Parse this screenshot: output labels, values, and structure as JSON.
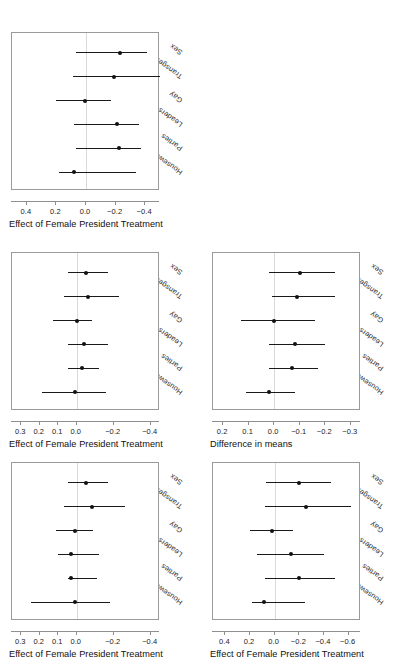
{
  "chart_data": [
    {
      "id": "panel-top-left",
      "type": "scatter",
      "title": "",
      "xlabel": "Effect of Female President Treatment",
      "ylabel": "",
      "xlim": [
        0.5,
        -0.5
      ],
      "xticks": [
        0.4,
        0.2,
        0.0,
        -0.2,
        -0.4
      ],
      "xticklabels": [
        "0.4",
        "0.2",
        "0.0",
        "-0.2",
        "-0.4"
      ],
      "categories": [
        "Sex",
        "Transgender",
        "Gay",
        "Leaders",
        "Parties",
        "Housework"
      ],
      "grid": false,
      "reference_line": 0.0,
      "points": [
        {
          "category": "Sex",
          "estimate": -0.23,
          "low": 0.07,
          "high": -0.41
        },
        {
          "category": "Transgender",
          "estimate": -0.19,
          "low": 0.09,
          "high": -0.5
        },
        {
          "category": "Gay",
          "estimate": 0.01,
          "low": 0.2,
          "high": -0.17
        },
        {
          "category": "Leaders",
          "estimate": -0.21,
          "low": 0.08,
          "high": -0.36
        },
        {
          "category": "Parties",
          "estimate": -0.22,
          "low": 0.07,
          "high": -0.37
        },
        {
          "category": "Housework",
          "estimate": 0.08,
          "low": 0.18,
          "high": -0.34
        }
      ]
    },
    {
      "id": "panel-mid-left",
      "type": "scatter",
      "title": "",
      "xlabel": "Effect of Female President Treatment",
      "ylabel": "",
      "xlim": [
        0.35,
        -0.45
      ],
      "xticks": [
        0.3,
        0.2,
        0.1,
        0.0,
        -0.2,
        -0.4
      ],
      "xticklabels": [
        "0.3",
        "0.2",
        "0.1",
        "0.0",
        "-0.2",
        "-0.4"
      ],
      "categories": [
        "Sex",
        "Transgender",
        "Gay",
        "Leaders",
        "Parties",
        "Housework"
      ],
      "grid": false,
      "reference_line": 0.0,
      "points": [
        {
          "category": "Sex",
          "estimate": -0.05,
          "low": 0.05,
          "high": -0.17
        },
        {
          "category": "Transgender",
          "estimate": -0.06,
          "low": 0.07,
          "high": -0.23
        },
        {
          "category": "Gay",
          "estimate": 0.0,
          "low": 0.13,
          "high": -0.08
        },
        {
          "category": "Leaders",
          "estimate": -0.04,
          "low": 0.05,
          "high": -0.17
        },
        {
          "category": "Parties",
          "estimate": -0.03,
          "low": 0.05,
          "high": -0.12
        },
        {
          "category": "Housework",
          "estimate": 0.01,
          "low": 0.19,
          "high": -0.16
        }
      ]
    },
    {
      "id": "panel-mid-right",
      "type": "scatter",
      "title": "",
      "xlabel": "Difference in means",
      "ylabel": "",
      "xlim": [
        0.24,
        -0.34
      ],
      "xticks": [
        0.2,
        0.1,
        0.0,
        -0.1,
        -0.2,
        -0.3
      ],
      "xticklabels": [
        "0.2",
        "0.1",
        "0.0",
        "-0.1",
        "-0.2",
        "-0.3"
      ],
      "categories": [
        "Sex",
        "Transgender",
        "Gay",
        "Leaders",
        "Parties",
        "Housework"
      ],
      "grid": false,
      "reference_line": 0.0,
      "points": [
        {
          "category": "Sex",
          "estimate": -0.1,
          "low": 0.02,
          "high": -0.24
        },
        {
          "category": "Transgender",
          "estimate": -0.09,
          "low": 0.01,
          "high": -0.24
        },
        {
          "category": "Gay",
          "estimate": 0.0,
          "low": 0.13,
          "high": -0.16
        },
        {
          "category": "Leaders",
          "estimate": -0.08,
          "low": 0.02,
          "high": -0.2
        },
        {
          "category": "Parties",
          "estimate": -0.07,
          "low": 0.02,
          "high": -0.17
        },
        {
          "category": "Housework",
          "estimate": 0.02,
          "low": 0.11,
          "high": -0.08
        }
      ]
    },
    {
      "id": "panel-bottom-left",
      "type": "scatter",
      "title": "",
      "xlabel": "Effect of Female President Treatment",
      "ylabel": "",
      "xlim": [
        0.35,
        -0.45
      ],
      "xticks": [
        0.3,
        0.2,
        0.1,
        0.0,
        -0.2,
        -0.4
      ],
      "xticklabels": [
        "0.3",
        "0.2",
        "0.1",
        "0.0",
        "-0.2",
        "-0.4"
      ],
      "categories": [
        "Sex",
        "Transgender",
        "Gay",
        "Leaders",
        "Parties",
        "Housework"
      ],
      "grid": false,
      "reference_line": 0.0,
      "points": [
        {
          "category": "Sex",
          "estimate": -0.05,
          "low": 0.05,
          "high": -0.17
        },
        {
          "category": "Transgender",
          "estimate": -0.08,
          "low": 0.07,
          "high": -0.26
        },
        {
          "category": "Gay",
          "estimate": 0.01,
          "low": 0.11,
          "high": -0.09
        },
        {
          "category": "Leaders",
          "estimate": 0.03,
          "low": 0.1,
          "high": -0.12
        },
        {
          "category": "Parties",
          "estimate": 0.03,
          "low": 0.05,
          "high": -0.11
        },
        {
          "category": "Housework",
          "estimate": 0.01,
          "low": 0.25,
          "high": -0.18
        }
      ]
    },
    {
      "id": "panel-bottom-right",
      "type": "scatter",
      "title": "",
      "xlabel": "Effect of Female President Treatment",
      "ylabel": "",
      "xlim": [
        0.5,
        -0.7
      ],
      "xticks": [
        0.4,
        0.2,
        0.0,
        -0.2,
        -0.4,
        -0.6
      ],
      "xticklabels": [
        "0.4",
        "0.2",
        "0.0",
        "-0.2",
        "-0.4",
        "-0.6"
      ],
      "categories": [
        "Sex",
        "Transgender",
        "Gay",
        "Leaders",
        "Parties",
        "Housework"
      ],
      "grid": false,
      "reference_line": 0.0,
      "points": [
        {
          "category": "Sex",
          "estimate": -0.2,
          "low": 0.07,
          "high": -0.46
        },
        {
          "category": "Transgender",
          "estimate": -0.25,
          "low": 0.08,
          "high": -0.62
        },
        {
          "category": "Gay",
          "estimate": 0.02,
          "low": 0.2,
          "high": -0.15
        },
        {
          "category": "Leaders",
          "estimate": -0.13,
          "low": 0.14,
          "high": -0.4
        },
        {
          "category": "Parties",
          "estimate": -0.2,
          "low": 0.08,
          "high": -0.49
        },
        {
          "category": "Housework",
          "estimate": 0.09,
          "low": 0.18,
          "high": -0.25
        }
      ]
    }
  ],
  "layout": {
    "panels": [
      {
        "ref": "panel-top-left",
        "left": 11,
        "top": 32,
        "width": 148,
        "height": 158
      },
      {
        "ref": "panel-mid-left",
        "left": 11,
        "top": 252,
        "width": 148,
        "height": 158
      },
      {
        "ref": "panel-mid-right",
        "left": 212,
        "top": 252,
        "width": 148,
        "height": 158
      },
      {
        "ref": "panel-bottom-left",
        "left": 11,
        "top": 462,
        "width": 148,
        "height": 158
      },
      {
        "ref": "panel-bottom-right",
        "left": 212,
        "top": 462,
        "width": 148,
        "height": 158
      }
    ]
  }
}
